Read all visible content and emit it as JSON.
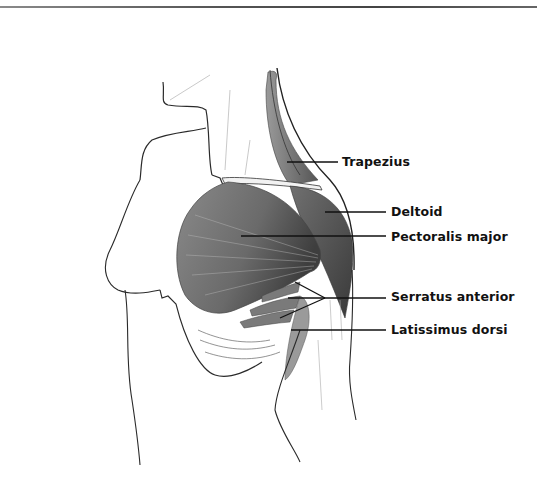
{
  "figure": {
    "type": "anatomical illustration"
  },
  "labels": [
    {
      "text": "Trapezius",
      "x": 342,
      "y": 155
    },
    {
      "text": "Deltoid",
      "x": 391,
      "y": 205
    },
    {
      "text": "Pectoralis major",
      "x": 391,
      "y": 230
    },
    {
      "text": "Serratus anterior",
      "x": 391,
      "y": 290
    },
    {
      "text": "Latissimus dorsi",
      "x": 391,
      "y": 323
    }
  ],
  "colors": {
    "line": "#111111",
    "muscle_dark": "#5a5a5a",
    "muscle_mid": "#8c8c8c",
    "outline": "#2a2a2a",
    "background": "#ffffff"
  }
}
